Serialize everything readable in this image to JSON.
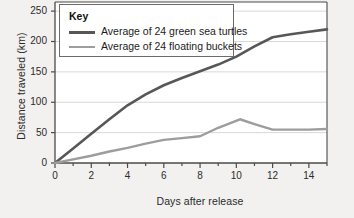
{
  "chart_data": {
    "type": "line",
    "title": "",
    "xlabel": "Days after release",
    "ylabel": "Distance traveled (km)",
    "xlim": [
      0,
      15
    ],
    "ylim": [
      0,
      265
    ],
    "xticks": [
      0,
      2,
      4,
      6,
      8,
      10,
      12,
      14
    ],
    "yticks": [
      0,
      50,
      100,
      150,
      200,
      250
    ],
    "grid": "horizontal",
    "legend": {
      "title": "Key",
      "position": "top-left-inside"
    },
    "series": [
      {
        "name": "Average of 24 green sea turtles",
        "color": "#575757",
        "width": 2.6,
        "x": [
          0,
          1,
          2,
          3,
          4,
          5,
          6,
          7,
          8,
          9,
          10,
          11,
          12,
          13,
          14,
          15
        ],
        "values": [
          0,
          24,
          48,
          72,
          95,
          113,
          128,
          140,
          151,
          162,
          175,
          192,
          207,
          212,
          216,
          220
        ]
      },
      {
        "name": "Average of 24 floating buckets",
        "color": "#9d9d9d",
        "width": 2.4,
        "x": [
          0,
          1,
          2,
          3,
          4,
          5,
          6,
          7,
          8,
          9,
          10.2,
          11,
          12,
          13,
          14,
          15
        ],
        "values": [
          0,
          6,
          12,
          19,
          25,
          32,
          38,
          41,
          44,
          58,
          72,
          64,
          55,
          55,
          55,
          56
        ]
      }
    ]
  },
  "axes": {
    "y_tick_labels": [
      "250",
      "200",
      "150",
      "100",
      "50",
      "0"
    ],
    "x_tick_labels": [
      "0",
      "2",
      "4",
      "6",
      "8",
      "10",
      "12",
      "14"
    ],
    "y_axis_title": "Distance traveled (km)",
    "x_axis_title": "Days after release"
  },
  "legend": {
    "title": "Key",
    "entries": [
      {
        "label": "Average of 24 green sea turtles",
        "color": "#575757"
      },
      {
        "label": "Average of 24 floating buckets",
        "color": "#9d9d9d"
      }
    ]
  },
  "colors": {
    "background": "#f2f1ef",
    "plot_background": "#ffffff",
    "axis": "#4a4a4a",
    "gridline": "#d8d8d8",
    "turtle_line": "#575757",
    "bucket_line": "#9d9d9d",
    "text": "#2b2b2b"
  }
}
